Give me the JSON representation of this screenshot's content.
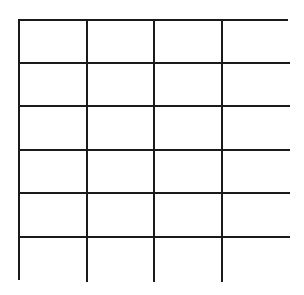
{
  "grid": {
    "rows": 6,
    "columns": 4,
    "line_color": "#1a1a1a",
    "background": "#ffffff",
    "cells": [
      [
        "",
        "",
        "",
        ""
      ],
      [
        "",
        "",
        "",
        ""
      ],
      [
        "",
        "",
        "",
        ""
      ],
      [
        "",
        "",
        "",
        ""
      ],
      [
        "",
        "",
        "",
        ""
      ],
      [
        "",
        "",
        "",
        ""
      ]
    ]
  }
}
